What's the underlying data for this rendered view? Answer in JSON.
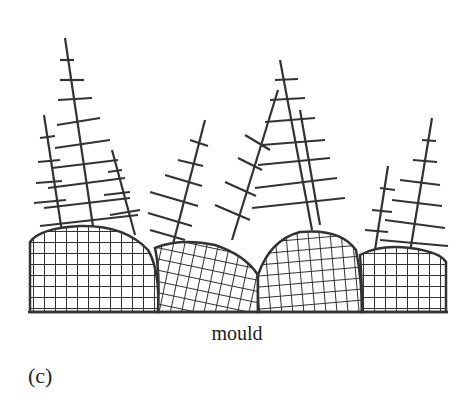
{
  "figure": {
    "caption_label": "mould",
    "panel_label": "(c)",
    "line_color": "#333333",
    "background": "#ffffff"
  },
  "grains": [
    {
      "name": "grain-1",
      "x0": 30,
      "x1": 160,
      "top": 228,
      "dendrite_tip": [
        65,
        38
      ],
      "base": [
        95,
        240
      ]
    },
    {
      "name": "grain-2",
      "x0": 155,
      "x1": 260,
      "top": 242,
      "dendrite_tip": [
        205,
        120
      ],
      "base": [
        175,
        250
      ]
    },
    {
      "name": "grain-3",
      "x0": 255,
      "x1": 360,
      "top": 230,
      "dendrite_tip": [
        280,
        85
      ],
      "base": [
        275,
        235
      ]
    },
    {
      "name": "grain-4",
      "x0": 360,
      "x1": 446,
      "top": 248,
      "dendrite_tip": [
        432,
        118
      ],
      "base": [
        405,
        255
      ]
    }
  ]
}
